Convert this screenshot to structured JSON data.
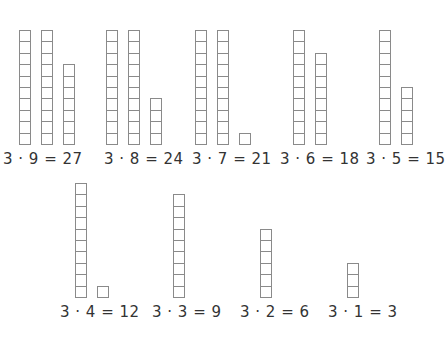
{
  "cell_color": "#8a8a8a",
  "groups": [
    {
      "label": "3 · 9 = 27",
      "columns": [
        10,
        10,
        7
      ],
      "x": 19,
      "bottom": 145,
      "label_x": 3,
      "label_y": 150
    },
    {
      "label": "3 · 8 = 24",
      "columns": [
        10,
        10,
        4
      ],
      "x": 106,
      "bottom": 145,
      "label_x": 104,
      "label_y": 150
    },
    {
      "label": "3 · 7 = 21",
      "columns": [
        10,
        10,
        1
      ],
      "x": 195,
      "bottom": 145,
      "label_x": 192,
      "label_y": 150
    },
    {
      "label": "3 · 6 = 18",
      "columns": [
        10,
        8
      ],
      "x": 293,
      "bottom": 145,
      "label_x": 280,
      "label_y": 150
    },
    {
      "label": "3 · 5 = 15",
      "columns": [
        10,
        5
      ],
      "x": 379,
      "bottom": 145,
      "label_x": 366,
      "label_y": 150
    },
    {
      "label": "3 · 4 = 12",
      "columns": [
        10,
        1
      ],
      "x": 75,
      "bottom": 298,
      "label_x": 60,
      "label_y": 303
    },
    {
      "label": "3 · 3 = 9",
      "columns": [
        9
      ],
      "x": 173,
      "bottom": 298,
      "label_x": 152,
      "label_y": 303
    },
    {
      "label": "3 · 2 = 6",
      "columns": [
        6
      ],
      "x": 260,
      "bottom": 298,
      "label_x": 240,
      "label_y": 303
    },
    {
      "label": "3 · 1 = 3",
      "columns": [
        3
      ],
      "x": 347,
      "bottom": 298,
      "label_x": 328,
      "label_y": 303
    }
  ],
  "column_gap": 22
}
